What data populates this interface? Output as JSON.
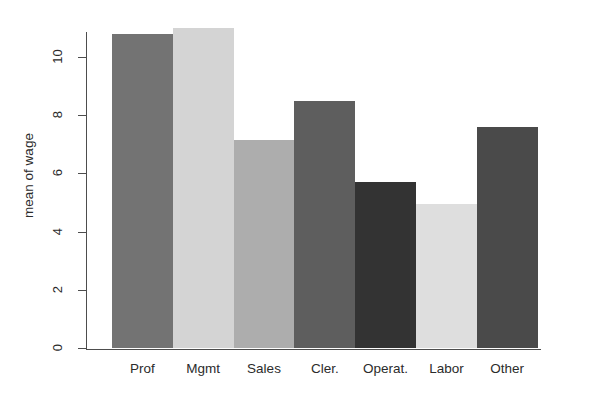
{
  "chart_data": {
    "type": "bar",
    "title": "",
    "subtitle": "",
    "xlabel": "",
    "ylabel": "mean of wage",
    "categories": [
      "Prof",
      "Mgmt",
      "Sales",
      "Cler.",
      "Operat.",
      "Labor",
      "Other"
    ],
    "values": [
      10.8,
      11.0,
      7.15,
      8.5,
      5.7,
      4.95,
      7.6
    ],
    "series": [
      {
        "name": "mean of wage",
        "values": [
          10.8,
          11.0,
          7.15,
          8.5,
          5.7,
          4.95,
          7.6
        ]
      }
    ],
    "bar_colors": [
      "#737373",
      "#d4d4d4",
      "#adadad",
      "#5e5e5e",
      "#333333",
      "#dedede",
      "#4a4a4a"
    ],
    "ylim": [
      0,
      11.6
    ],
    "xlim": [
      0,
      7
    ],
    "y_ticks": [
      0,
      2,
      4,
      6,
      8,
      10
    ],
    "y_tick_labels": [
      "0",
      "2",
      "4",
      "6",
      "8",
      "10"
    ],
    "x_tick_labels": [
      "Prof",
      "Mgmt",
      "Sales",
      "Cler.",
      "Operat.",
      "Labor",
      "Other"
    ],
    "grid": false,
    "legend": false,
    "legend_position": "none",
    "bars_adjacent": true,
    "axis_color": "#4d4d4d",
    "text_color": "#2b2b2b",
    "background_color": "#ffffff"
  }
}
